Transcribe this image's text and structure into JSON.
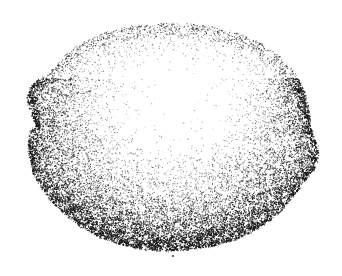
{
  "figure": {
    "domain": "Natural-Image",
    "description": "Pen-and-ink stipple drawing of a rounded, slightly lobed organic specimen viewed from above",
    "medium": "stipple / pointillist line drawing",
    "caption_text": "",
    "canvas": {
      "width": 342,
      "height": 276,
      "background_color": "#ffffff",
      "ink_color": "#1a1a1a"
    },
    "specimen": {
      "name": "rounded lobed specimen",
      "bounds": {
        "left": 28,
        "top": 24,
        "right": 318,
        "bottom": 250
      },
      "center": {
        "x": 173,
        "y": 140
      },
      "radius_x": 143,
      "radius_y": 112,
      "outline_points": [
        [
          172,
          24
        ],
        [
          196,
          25
        ],
        [
          220,
          29
        ],
        [
          243,
          36
        ],
        [
          263,
          46
        ],
        [
          280,
          58
        ],
        [
          293,
          72
        ],
        [
          302,
          87
        ],
        [
          307,
          101
        ],
        [
          309,
          114
        ],
        [
          310,
          126
        ],
        [
          313,
          136
        ],
        [
          317,
          146
        ],
        [
          318,
          157
        ],
        [
          315,
          167
        ],
        [
          308,
          176
        ],
        [
          300,
          186
        ],
        [
          292,
          197
        ],
        [
          283,
          208
        ],
        [
          271,
          219
        ],
        [
          256,
          229
        ],
        [
          238,
          238
        ],
        [
          218,
          244
        ],
        [
          197,
          248
        ],
        [
          176,
          250
        ],
        [
          155,
          250
        ],
        [
          134,
          247
        ],
        [
          114,
          242
        ],
        [
          95,
          234
        ],
        [
          78,
          224
        ],
        [
          63,
          212
        ],
        [
          50,
          199
        ],
        [
          40,
          185
        ],
        [
          33,
          170
        ],
        [
          30,
          156
        ],
        [
          29,
          143
        ],
        [
          31,
          132
        ],
        [
          36,
          124
        ],
        [
          33,
          116
        ],
        [
          29,
          107
        ],
        [
          28,
          97
        ],
        [
          31,
          88
        ],
        [
          38,
          80
        ],
        [
          48,
          74
        ],
        [
          56,
          67
        ],
        [
          63,
          58
        ],
        [
          73,
          49
        ],
        [
          86,
          41
        ],
        [
          102,
          34
        ],
        [
          120,
          29
        ],
        [
          140,
          26
        ],
        [
          156,
          24
        ]
      ],
      "lobes": [
        {
          "name": "upper-left-lobe",
          "x": 33,
          "y": 92,
          "note": "small bump above notch"
        },
        {
          "name": "left-notch",
          "x": 34,
          "y": 118,
          "note": "concave indentation"
        },
        {
          "name": "lower-left-lobe",
          "x": 31,
          "y": 150,
          "note": "broad bulge"
        },
        {
          "name": "right-bulge",
          "x": 316,
          "y": 152,
          "note": "pointed bulge on right rim"
        }
      ]
    },
    "shading": {
      "style": "stipple density gradient",
      "highlight": {
        "name": "upper-center-highlight",
        "x": 178,
        "y": 92,
        "radius_x": 100,
        "radius_y": 70,
        "density": "very sparse / near blank"
      },
      "light_direction": "upper-center",
      "darkest_region": "lower rim and bottom edge",
      "rim_band_px": 14,
      "total_dots": 16000,
      "dot_size_range_px": [
        0.5,
        1.7
      ]
    },
    "marks": [
      {
        "name": "bottom-tick",
        "x": 173,
        "y": 256,
        "note": "small isolated ink speck below lower edge"
      }
    ]
  }
}
